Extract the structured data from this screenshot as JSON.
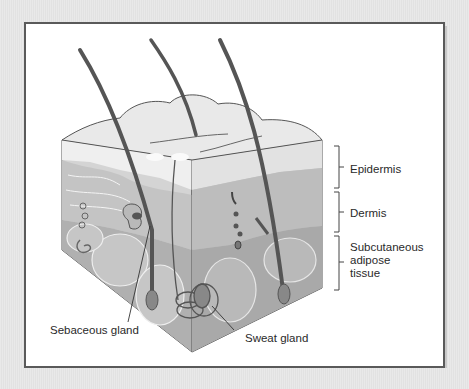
{
  "figure": {
    "labels": {
      "epidermis": "Epidermis",
      "dermis": "Dermis",
      "subcutaneous": "Subcutaneous\nadipose\ntissue",
      "sebaceous_gland": "Sebaceous gland",
      "sweat_gland": "Sweat gland"
    },
    "colors": {
      "background": "#e6e6e6",
      "frame_border": "#5a5a5a",
      "epidermis_fill": "#e4e4e4",
      "dermis_fill": "#c9c9c9",
      "adipose_fill": "#b3b3b3",
      "hair": "#555555"
    }
  }
}
